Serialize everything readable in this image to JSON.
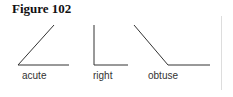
{
  "title": "Figure 102",
  "angles": [
    {
      "name": "acute",
      "label": "acute"
    },
    {
      "name": "right",
      "label": "right"
    },
    {
      "name": "obtuse",
      "label": "obtuse"
    }
  ],
  "colors": {
    "line": "#333333",
    "divider": "#dddddd"
  }
}
